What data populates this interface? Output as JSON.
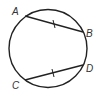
{
  "diagram": {
    "type": "circle-with-congruent-chords",
    "circle": {
      "cx": 48,
      "cy": 48.5,
      "r": 39
    },
    "points": {
      "A": {
        "label": "A",
        "x": 25,
        "y": 16,
        "label_x": 12,
        "label_y": 15
      },
      "B": {
        "label": "B",
        "x": 83,
        "y": 32,
        "label_x": 86,
        "label_y": 37
      },
      "C": {
        "label": "C",
        "x": 25,
        "y": 80,
        "label_x": 12,
        "label_y": 89
      },
      "D": {
        "label": "D",
        "x": 83,
        "y": 65,
        "label_x": 86,
        "label_y": 72
      }
    },
    "chords": [
      {
        "name": "AB",
        "from": "A",
        "to": "B",
        "tick_marks": 1
      },
      {
        "name": "CD",
        "from": "C",
        "to": "D",
        "tick_marks": 1
      }
    ],
    "colors": {
      "stroke": "#222222",
      "label": "#333333"
    }
  }
}
